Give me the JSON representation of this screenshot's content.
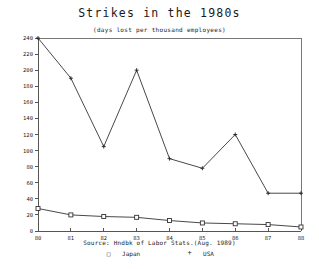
{
  "chart_data": {
    "type": "line",
    "title": "Strikes in the 1980s",
    "subtitle": "(days lost per thousand employees)",
    "source": "Source: Hndbk of Labor Stats.(Aug. 1989)",
    "xlabel": "",
    "ylabel": "",
    "grid": false,
    "legend_position": "bottom",
    "categories": [
      "80",
      "81",
      "82",
      "83",
      "84",
      "85",
      "86",
      "87",
      "88"
    ],
    "x": [
      80,
      81,
      82,
      83,
      84,
      85,
      86,
      87,
      88
    ],
    "xlim": [
      80,
      88
    ],
    "ylim": [
      0,
      240
    ],
    "ytick_step": 20,
    "yticks": [
      0,
      20,
      40,
      60,
      80,
      100,
      120,
      140,
      160,
      180,
      200,
      220,
      240
    ],
    "xticks": [
      "80",
      "81",
      "82",
      "83",
      "84",
      "85",
      "86",
      "87",
      "88"
    ],
    "series": [
      {
        "name": "USA",
        "marker": "plus",
        "values": [
          240,
          190,
          105,
          200,
          90,
          78,
          120,
          47,
          47
        ]
      },
      {
        "name": "Japan",
        "marker": "square",
        "values": [
          28,
          20,
          18,
          17,
          13,
          10,
          9,
          8,
          5
        ]
      }
    ],
    "legend": [
      {
        "symbol": "□",
        "label": "Japan"
      },
      {
        "symbol": "+",
        "label": "USA"
      }
    ]
  },
  "colors": {
    "line": "#333333",
    "axis": "#555555",
    "frame": "#777777",
    "text": "#222222",
    "background": "#ffffff"
  }
}
